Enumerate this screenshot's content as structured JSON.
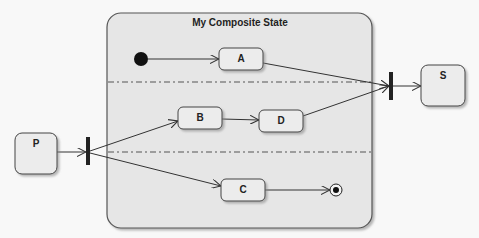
{
  "diagram": {
    "type": "uml-state-machine",
    "composite": {
      "title": "My Composite State",
      "regions": 3
    },
    "states": {
      "A": "A",
      "B": "B",
      "C": "C",
      "D": "D",
      "P": "P",
      "S": "S"
    },
    "pseudostates": [
      "initial",
      "fork",
      "join",
      "final"
    ],
    "transitions": [
      {
        "from": "initial",
        "to": "A"
      },
      {
        "from": "A",
        "to": "join"
      },
      {
        "from": "P",
        "to": "fork"
      },
      {
        "from": "fork",
        "to": "B"
      },
      {
        "from": "fork",
        "to": "C"
      },
      {
        "from": "B",
        "to": "D"
      },
      {
        "from": "D",
        "to": "join"
      },
      {
        "from": "C",
        "to": "final"
      },
      {
        "from": "join",
        "to": "S"
      }
    ],
    "colors": {
      "stroke": "#333333",
      "fill": "#ebebeb",
      "composite_fill": "#e6e6e6",
      "bar": "#222222"
    }
  }
}
